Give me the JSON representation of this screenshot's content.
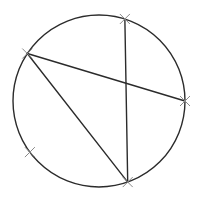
{
  "diagram": {
    "type": "circle-with-chords",
    "colors": {
      "background": "#ffffff",
      "line": "#2b2b2b",
      "marker": "#8a8a8a"
    },
    "points": [
      {
        "id": "A",
        "label": "",
        "angle_deg": 72.5
      },
      {
        "id": "B",
        "label": "",
        "angle_deg": 146.5
      },
      {
        "id": "C",
        "label": "",
        "angle_deg": 0
      },
      {
        "id": "D",
        "label": "",
        "angle_deg": -70.5
      },
      {
        "id": "E",
        "label": "",
        "angle_deg": -143.5
      }
    ],
    "chords": [
      {
        "from": "A",
        "to": "D"
      },
      {
        "from": "B",
        "to": "C"
      },
      {
        "from": "B",
        "to": "D"
      }
    ],
    "marker_style": "x-cross"
  }
}
